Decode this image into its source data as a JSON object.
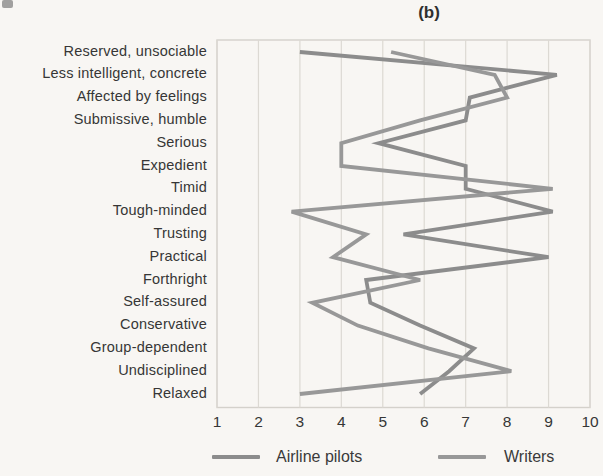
{
  "figure_title": "(b)",
  "chart_data": {
    "type": "line",
    "title": "(b)",
    "orientation": "horizontal-category-profile",
    "categories": [
      "Reserved, unsociable",
      "Less intelligent, concrete",
      "Affected by feelings",
      "Submissive, humble",
      "Serious",
      "Expedient",
      "Timid",
      "Tough-minded",
      "Trusting",
      "Practical",
      "Forthright",
      "Self-assured",
      "Conservative",
      "Group-dependent",
      "Undisciplined",
      "Relaxed"
    ],
    "x_axis": {
      "min": 1,
      "max": 10,
      "tick_labels": [
        "1",
        "2",
        "3",
        "4",
        "5",
        "6",
        "7",
        "8",
        "9",
        "10"
      ]
    },
    "grid": "vertical-gridlines-on",
    "series": [
      {
        "name": "Airline pilots",
        "color": "#8c8c8c",
        "values": [
          3.0,
          9.2,
          7.1,
          7.0,
          4.9,
          7.0,
          7.0,
          9.1,
          5.5,
          9.0,
          4.6,
          4.7,
          5.9,
          7.2,
          6.6,
          5.9
        ]
      },
      {
        "name": "Writers",
        "color": "#989898",
        "values": [
          5.2,
          7.7,
          8.0,
          5.9,
          4.0,
          4.0,
          9.1,
          2.8,
          4.6,
          3.8,
          5.9,
          3.3,
          4.4,
          6.1,
          8.1,
          3.0
        ]
      }
    ],
    "legend": {
      "position": "bottom",
      "entries": [
        "Airline pilots",
        "Writers"
      ]
    },
    "plot_colors": {
      "gridline": "#dcd9d3",
      "border": "#d4d1cb",
      "label_text": "#363636"
    }
  }
}
